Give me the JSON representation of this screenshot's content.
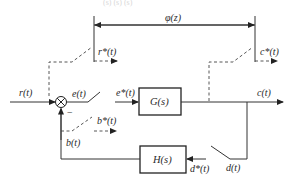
{
  "diagram": {
    "type": "sampled-data feedback control system block diagram",
    "top_caption_fragment": "(s)  (s)  (s)",
    "span_label": "φ(z)",
    "blocks": {
      "forward": "G(s)",
      "feedback": "H(s)"
    },
    "signals": {
      "input": "r(t)",
      "error": "e(t)",
      "sampled_error": "e*(t)",
      "output": "c(t)",
      "sampled_input": "r*(t)",
      "sampled_output": "c*(t)",
      "sampled_feedback": "b*(t)",
      "feedback": "b(t)",
      "d": "d(t)",
      "sampled_d": "d*(t)"
    },
    "summing_junction": {
      "symbol": "⊗",
      "feedback_sign": "−"
    },
    "colors": {
      "line": "#333333",
      "background": "#ffffff"
    }
  }
}
